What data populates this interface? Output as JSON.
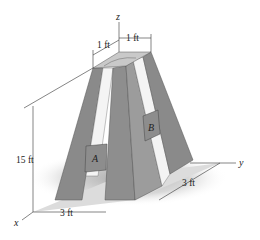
{
  "figure": {
    "type": "engineering-diagram",
    "axes": {
      "x": "x",
      "y": "y",
      "z": "z"
    },
    "blocks": [
      {
        "label": "A"
      },
      {
        "label": "B"
      }
    ],
    "dimensions": {
      "top_x": "1 ft",
      "top_y": "1 ft",
      "height": "15 ft",
      "base_x": "3 ft",
      "base_y": "3 ft"
    },
    "colors": {
      "leg_front": "#8a8a8a",
      "leg_side": "#9e9e9e",
      "leg_dark": "#6f6f6f",
      "top_face": "#c8c8c8",
      "block": "#8d8d8d",
      "floor": "#d9d9d9",
      "shadow": "#b8b8b8"
    }
  }
}
